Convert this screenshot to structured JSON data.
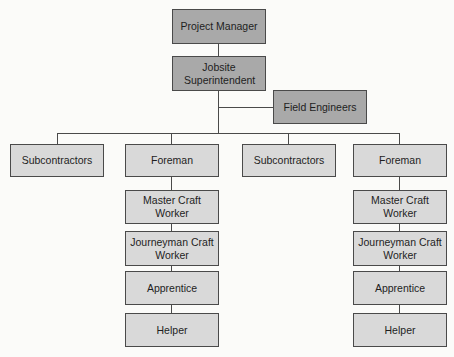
{
  "chart": {
    "top": {
      "project_manager": "Project Manager",
      "jobsite_superintendent": "Jobsite Superintendent",
      "field_engineers": "Field Engineers"
    },
    "level2": [
      {
        "label": "Subcontractors"
      },
      {
        "label": "Foreman",
        "chain": [
          "Master Craft Worker",
          "Journeyman Craft Worker",
          "Apprentice",
          "Helper"
        ]
      },
      {
        "label": "Subcontractors"
      },
      {
        "label": "Foreman",
        "chain": [
          "Master Craft Worker",
          "Journeyman Craft Worker",
          "Apprentice",
          "Helper"
        ]
      }
    ]
  }
}
